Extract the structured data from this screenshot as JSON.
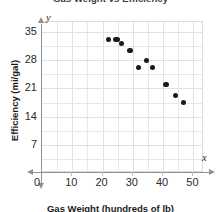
{
  "chart_data": {
    "type": "scatter",
    "title": "Gas Weight vs Efficiency",
    "xlabel": "Gas Weight (hundreds of lb)",
    "ylabel": "Efficiency (mi/gal)",
    "xlim": [
      0,
      53.5
    ],
    "ylim": [
      0,
      37.5
    ],
    "xticks": [
      10,
      20,
      30,
      40,
      50
    ],
    "yticks": [
      7,
      14,
      21,
      28,
      35
    ],
    "x_minor_step": 5,
    "origin_label": "0",
    "grid": true,
    "legend": "none",
    "axis_letter_x": "x",
    "axis_letter_y": "y",
    "point_color": "#1a1a1a",
    "grid_color": "#e3e9ef",
    "axis_color": "#8d9298",
    "points": [
      {
        "x": 22.0,
        "y": 33.2
      },
      {
        "x": 24.5,
        "y": 33.2
      },
      {
        "x": 26.3,
        "y": 32.2
      },
      {
        "x": 29.0,
        "y": 30.4
      },
      {
        "x": 31.8,
        "y": 26.2
      },
      {
        "x": 34.5,
        "y": 28.0
      },
      {
        "x": 36.5,
        "y": 26.2
      },
      {
        "x": 41.0,
        "y": 22.0
      },
      {
        "x": 44.0,
        "y": 19.3
      },
      {
        "x": 46.8,
        "y": 17.5
      },
      {
        "x": 25.0,
        "y": 33.1
      }
    ]
  }
}
